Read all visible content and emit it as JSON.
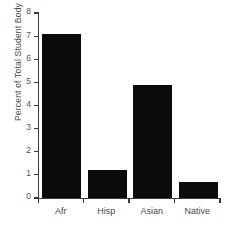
{
  "chart_data": {
    "type": "bar",
    "title": "",
    "categories": [
      "Afr",
      "Hisp",
      "Asian",
      "Native"
    ],
    "values": [
      7.1,
      1.2,
      4.9,
      0.7
    ],
    "xlabel": "",
    "ylabel": "Percent of Total Student Body",
    "ylim": [
      0,
      8
    ],
    "yticks": [
      "0",
      "1",
      "2",
      "3",
      "4",
      "5",
      "6",
      "7",
      "8"
    ],
    "ytick_values": [
      0,
      1,
      2,
      3,
      4,
      5,
      6,
      7,
      8
    ],
    "grid": false,
    "legend": false,
    "bar_color": "#0b0b0b",
    "axis_color": "#3a3a3a",
    "text_color": "#4a4a4a",
    "background": "#ffffff"
  }
}
